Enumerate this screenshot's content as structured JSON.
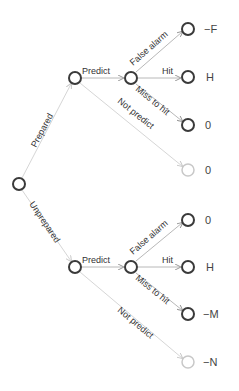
{
  "diagram": {
    "type": "decision-tree",
    "edges": {
      "prepared": "Prepared",
      "unprepared": "Unprepared",
      "top_predict": "Predict",
      "top_not_predict": "Not predict",
      "top_false_alarm": "False alarm",
      "top_hit": "Hit",
      "top_miss": "Miss to hit",
      "bot_predict": "Predict",
      "bot_not_predict": "Not predict",
      "bot_false_alarm": "False alarm",
      "bot_hit": "Hit",
      "bot_miss": "Miss to hit"
    },
    "payoffs": {
      "prepared_false_alarm": "−F",
      "prepared_hit": "H",
      "prepared_miss": "0",
      "prepared_not_predict": "0",
      "unprepared_false_alarm": "0",
      "unprepared_hit": "H",
      "unprepared_miss": "−M",
      "unprepared_not_predict": "−N"
    }
  }
}
